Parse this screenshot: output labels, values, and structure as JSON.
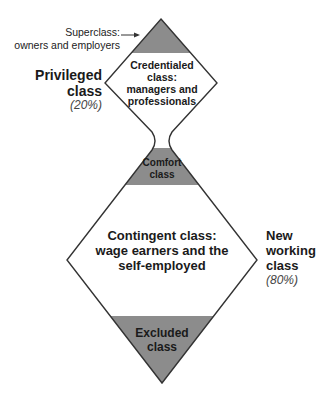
{
  "diagram": {
    "title": "",
    "colors": {
      "shaded": "#8c8c8c",
      "outline": "#333333",
      "fill": "#ffffff"
    },
    "superclass": {
      "line1": "Superclass:",
      "line2": "owners and employers"
    },
    "credentialed": {
      "line1": "Credentialed",
      "line2": "class:",
      "line3": "managers and",
      "line4": "professionals"
    },
    "comfort": {
      "line1": "Comfort",
      "line2": "class"
    },
    "contingent": {
      "line1": "Contingent class:",
      "line2": "wage earners and the",
      "line3": "self-employed"
    },
    "excluded": {
      "line1": "Excluded",
      "line2": "class"
    },
    "privileged": {
      "line1": "Privileged",
      "line2": "class",
      "percent": "(20%)"
    },
    "new_working": {
      "line1": "New",
      "line2": "working",
      "line3": "class",
      "percent": "(80%)"
    }
  }
}
